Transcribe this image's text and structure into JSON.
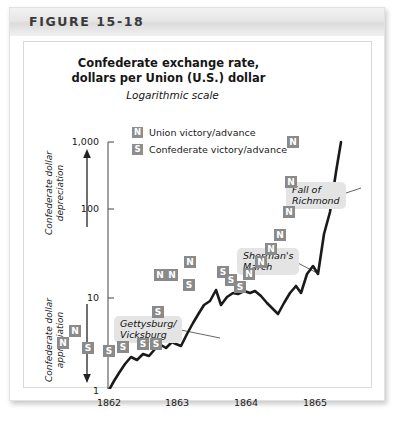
{
  "figure": {
    "label": "FIGURE 15-18"
  },
  "chart_data": {
    "type": "line",
    "title": "Confederate exchange rate,\ndollars per Union (U.S.) dollar",
    "title_line1": "Confederate exchange rate,",
    "title_line2": "dollars per Union (U.S.) dollar",
    "subtitle": "Logarithmic scale",
    "xlabel": "",
    "ylabel": "",
    "yscale": "log",
    "ylim": [
      1,
      1000
    ],
    "xlim": [
      "1862",
      "1865.5"
    ],
    "grid": false,
    "legend_position": "top-center",
    "yticks": [
      "1,000",
      "100",
      "10",
      "1"
    ],
    "ytick_values": [
      1000,
      100,
      10,
      1
    ],
    "xticks": [
      "1862",
      "1863",
      "1864",
      "1865"
    ],
    "xtick_values": [
      1862,
      1863,
      1864,
      1865
    ],
    "legend": [
      {
        "marker": "N",
        "label": "Union victory/advance"
      },
      {
        "marker": "S",
        "label": "Confederate victory/advance"
      }
    ],
    "axis_annotations": [
      {
        "name": "depreciation",
        "text_line1": "Confederate dollar",
        "text_line2": "depreciation",
        "arrow": "up"
      },
      {
        "name": "appreciation",
        "text_line1": "Confederate dollar",
        "text_line2": "appreciation",
        "arrow": "down"
      }
    ],
    "callouts": [
      {
        "name": "gettysburg-vicksburg",
        "line1": "Gettysburg/",
        "line2": "Vicksburg"
      },
      {
        "name": "shermans-march",
        "line1": "Sherman's",
        "line2": "March"
      },
      {
        "name": "fall-of-richmond",
        "line1": "Fall of",
        "line2": "Richmond"
      }
    ],
    "series": [
      {
        "name": "Confederate exchange rate",
        "x": [
          1862.0,
          1862.08,
          1862.17,
          1862.25,
          1862.33,
          1862.42,
          1862.5,
          1862.58,
          1862.67,
          1862.75,
          1862.83,
          1862.92,
          1863.0,
          1863.08,
          1863.17,
          1863.25,
          1863.33,
          1863.42,
          1863.5,
          1863.58,
          1863.67,
          1863.75,
          1863.83,
          1863.92,
          1864.0,
          1864.08,
          1864.17,
          1864.25,
          1864.33,
          1864.42,
          1864.5,
          1864.58,
          1864.67,
          1864.75,
          1864.83,
          1864.92,
          1865.0,
          1865.08,
          1865.17,
          1865.25,
          1865.33,
          1865.42
        ],
        "values": [
          1.05,
          1.4,
          1.9,
          2.4,
          2.3,
          2.6,
          2.5,
          2.9,
          3.1,
          3.4,
          3.2,
          3.6,
          3.4,
          3.3,
          4.6,
          6.0,
          7.6,
          9.5,
          10.0,
          13.0,
          9.5,
          11.5,
          12.5,
          12.2,
          12.8,
          12.5,
          13.0,
          12.0,
          10.5,
          9.2,
          8.3,
          10.5,
          12.5,
          14.5,
          13.0,
          19.0,
          24.0,
          20.0,
          60.0,
          110.0,
          400.0,
          1000.0
        ]
      }
    ],
    "points": [
      {
        "marker": "N",
        "x_px": 114,
        "y_px": 357
      },
      {
        "marker": "N",
        "x_px": 126,
        "y_px": 345
      },
      {
        "marker": "S",
        "x_px": 139,
        "y_px": 362
      },
      {
        "marker": "S",
        "x_px": 160,
        "y_px": 365
      },
      {
        "marker": "S",
        "x_px": 174,
        "y_px": 361
      },
      {
        "marker": "S",
        "x_px": 194,
        "y_px": 358
      },
      {
        "marker": "S",
        "x_px": 207,
        "y_px": 358
      },
      {
        "marker": "S",
        "x_px": 209,
        "y_px": 326
      },
      {
        "marker": "N",
        "x_px": 211,
        "y_px": 289
      },
      {
        "marker": "N",
        "x_px": 223,
        "y_px": 289
      },
      {
        "marker": "N",
        "x_px": 241,
        "y_px": 276
      },
      {
        "marker": "S",
        "x_px": 240,
        "y_px": 299
      },
      {
        "marker": "S",
        "x_px": 274,
        "y_px": 286
      },
      {
        "marker": "S",
        "x_px": 282,
        "y_px": 294
      },
      {
        "marker": "S",
        "x_px": 291,
        "y_px": 301
      },
      {
        "marker": "N",
        "x_px": 300,
        "y_px": 288
      },
      {
        "marker": "N",
        "x_px": 312,
        "y_px": 276
      },
      {
        "marker": "N",
        "x_px": 322,
        "y_px": 263
      },
      {
        "marker": "N",
        "x_px": 331,
        "y_px": 249
      },
      {
        "marker": "N",
        "x_px": 340,
        "y_px": 226
      },
      {
        "marker": "N",
        "x_px": 342,
        "y_px": 196
      },
      {
        "marker": "N",
        "x_px": 344,
        "y_px": 156
      }
    ]
  }
}
